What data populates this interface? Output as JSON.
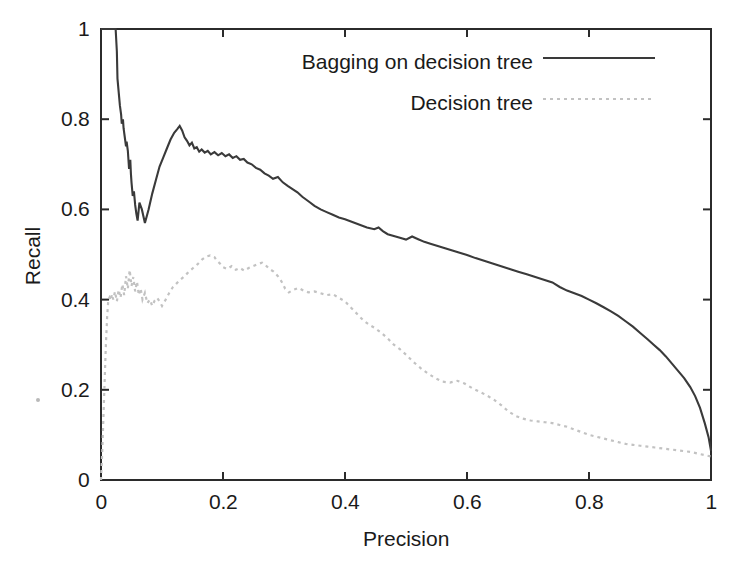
{
  "figure": {
    "background_color": "#ffffff",
    "frame_color": "#2b2b2b"
  },
  "axes": {
    "x": {
      "label": "Precision",
      "ticks": [
        "0",
        "0.2",
        "0.4",
        "0.6",
        "0.8",
        "1"
      ],
      "tick_values": [
        0,
        0.2,
        0.4,
        0.6,
        0.8,
        1
      ],
      "min": 0,
      "max": 1
    },
    "y": {
      "label": "Recall",
      "ticks": [
        "0",
        "0.2",
        "0.4",
        "0.6",
        "0.8",
        "1"
      ],
      "tick_values": [
        0,
        0.2,
        0.4,
        0.6,
        0.8,
        1
      ],
      "min": 0,
      "max": 1
    }
  },
  "legend": {
    "position": "top-right",
    "entries": [
      {
        "label": "Bagging on decision tree",
        "style": "solid",
        "color": "#3a3a3a",
        "width": 2.1
      },
      {
        "label": "Decision tree",
        "style": "dotted",
        "color": "#c2c2c2",
        "width": 2.1
      }
    ]
  },
  "chart_data": {
    "type": "line",
    "title": "",
    "xlabel": "Precision",
    "ylabel": "Recall",
    "xlim": [
      0,
      1
    ],
    "ylim": [
      0,
      1
    ],
    "grid": false,
    "legend_position": "top-right",
    "series": [
      {
        "name": "Bagging on decision tree",
        "style": "solid",
        "color": "#3a3a3a",
        "x": [
          0,
          0.004,
          0.01,
          0.018,
          0.024,
          0.026,
          0.027,
          0.029,
          0.031,
          0.033,
          0.034,
          0.036,
          0.037,
          0.039,
          0.041,
          0.042,
          0.044,
          0.045,
          0.046,
          0.048,
          0.049,
          0.05,
          0.052,
          0.054,
          0.056,
          0.058,
          0.06,
          0.063,
          0.067,
          0.072,
          0.078,
          0.084,
          0.09,
          0.096,
          0.102,
          0.108,
          0.114,
          0.12,
          0.125,
          0.129,
          0.133,
          0.137,
          0.141,
          0.145,
          0.149,
          0.153,
          0.157,
          0.161,
          0.165,
          0.17,
          0.175,
          0.18,
          0.186,
          0.192,
          0.198,
          0.204,
          0.21,
          0.216,
          0.222,
          0.228,
          0.234,
          0.24,
          0.247,
          0.254,
          0.261,
          0.268,
          0.275,
          0.282,
          0.29,
          0.298,
          0.306,
          0.314,
          0.322,
          0.33,
          0.34,
          0.35,
          0.36,
          0.37,
          0.38,
          0.39,
          0.4,
          0.412,
          0.424,
          0.436,
          0.448,
          0.455,
          0.462,
          0.47,
          0.48,
          0.49,
          0.5,
          0.51,
          0.52,
          0.53,
          0.54,
          0.552,
          0.564,
          0.576,
          0.588,
          0.6,
          0.614,
          0.628,
          0.642,
          0.656,
          0.67,
          0.684,
          0.698,
          0.712,
          0.726,
          0.74,
          0.752,
          0.764,
          0.776,
          0.788,
          0.8,
          0.812,
          0.824,
          0.836,
          0.848,
          0.86,
          0.872,
          0.884,
          0.896,
          0.906,
          0.916,
          0.926,
          0.936,
          0.946,
          0.956,
          0.966,
          0.974,
          0.982,
          0.99,
          0.996,
          1.0
        ],
        "y": [
          1.0,
          1.0,
          1.0,
          1.0,
          1.0,
          0.95,
          0.89,
          0.86,
          0.83,
          0.81,
          0.79,
          0.8,
          0.78,
          0.76,
          0.74,
          0.75,
          0.73,
          0.71,
          0.69,
          0.71,
          0.68,
          0.66,
          0.63,
          0.64,
          0.61,
          0.59,
          0.575,
          0.615,
          0.6,
          0.57,
          0.6,
          0.635,
          0.665,
          0.695,
          0.715,
          0.735,
          0.755,
          0.77,
          0.778,
          0.785,
          0.775,
          0.76,
          0.752,
          0.742,
          0.748,
          0.735,
          0.738,
          0.728,
          0.733,
          0.726,
          0.73,
          0.722,
          0.727,
          0.72,
          0.725,
          0.718,
          0.722,
          0.714,
          0.718,
          0.71,
          0.712,
          0.704,
          0.7,
          0.692,
          0.688,
          0.68,
          0.675,
          0.668,
          0.672,
          0.66,
          0.652,
          0.645,
          0.638,
          0.628,
          0.618,
          0.608,
          0.6,
          0.594,
          0.588,
          0.582,
          0.578,
          0.572,
          0.566,
          0.56,
          0.556,
          0.56,
          0.552,
          0.545,
          0.541,
          0.537,
          0.533,
          0.54,
          0.534,
          0.528,
          0.524,
          0.519,
          0.514,
          0.509,
          0.504,
          0.499,
          0.492,
          0.486,
          0.48,
          0.474,
          0.468,
          0.462,
          0.456,
          0.45,
          0.444,
          0.438,
          0.428,
          0.42,
          0.414,
          0.408,
          0.4,
          0.392,
          0.383,
          0.374,
          0.364,
          0.352,
          0.34,
          0.326,
          0.312,
          0.3,
          0.288,
          0.274,
          0.258,
          0.242,
          0.226,
          0.206,
          0.186,
          0.16,
          0.125,
          0.095,
          0.065
        ]
      },
      {
        "name": "Decision tree",
        "style": "dotted",
        "color": "#c2c2c2",
        "x": [
          0,
          0.002,
          0.004,
          0.006,
          0.008,
          0.01,
          0.012,
          0.014,
          0.016,
          0.018,
          0.02,
          0.023,
          0.026,
          0.029,
          0.032,
          0.035,
          0.038,
          0.041,
          0.044,
          0.047,
          0.05,
          0.053,
          0.056,
          0.059,
          0.062,
          0.065,
          0.068,
          0.072,
          0.076,
          0.08,
          0.084,
          0.088,
          0.092,
          0.096,
          0.1,
          0.106,
          0.112,
          0.118,
          0.124,
          0.13,
          0.137,
          0.144,
          0.151,
          0.158,
          0.165,
          0.172,
          0.179,
          0.186,
          0.19,
          0.195,
          0.2,
          0.207,
          0.214,
          0.221,
          0.228,
          0.235,
          0.242,
          0.249,
          0.256,
          0.264,
          0.27,
          0.276,
          0.283,
          0.29,
          0.296,
          0.302,
          0.308,
          0.316,
          0.324,
          0.332,
          0.34,
          0.35,
          0.36,
          0.37,
          0.38,
          0.39,
          0.4,
          0.41,
          0.42,
          0.43,
          0.44,
          0.45,
          0.46,
          0.47,
          0.48,
          0.49,
          0.5,
          0.512,
          0.524,
          0.536,
          0.548,
          0.56,
          0.572,
          0.584,
          0.596,
          0.608,
          0.62,
          0.632,
          0.644,
          0.656,
          0.668,
          0.68,
          0.692,
          0.704,
          0.716,
          0.728,
          0.74,
          0.752,
          0.764,
          0.776,
          0.788,
          0.8,
          0.812,
          0.824,
          0.836,
          0.848,
          0.86,
          0.872,
          0.884,
          0.896,
          0.908,
          0.92,
          0.932,
          0.944,
          0.956,
          0.968,
          0.98,
          0.99,
          1.0
        ],
        "y": [
          0.0,
          0.06,
          0.14,
          0.22,
          0.3,
          0.36,
          0.4,
          0.405,
          0.398,
          0.412,
          0.4,
          0.418,
          0.396,
          0.422,
          0.404,
          0.434,
          0.41,
          0.452,
          0.424,
          0.466,
          0.43,
          0.45,
          0.418,
          0.44,
          0.41,
          0.425,
          0.4,
          0.415,
          0.392,
          0.4,
          0.386,
          0.398,
          0.404,
          0.396,
          0.386,
          0.4,
          0.415,
          0.428,
          0.436,
          0.444,
          0.452,
          0.462,
          0.47,
          0.478,
          0.488,
          0.495,
          0.498,
          0.494,
          0.486,
          0.48,
          0.472,
          0.468,
          0.474,
          0.466,
          0.47,
          0.464,
          0.47,
          0.474,
          0.478,
          0.482,
          0.476,
          0.468,
          0.462,
          0.452,
          0.44,
          0.424,
          0.416,
          0.422,
          0.426,
          0.42,
          0.416,
          0.418,
          0.414,
          0.41,
          0.412,
          0.404,
          0.396,
          0.382,
          0.368,
          0.354,
          0.344,
          0.336,
          0.326,
          0.314,
          0.3,
          0.29,
          0.278,
          0.262,
          0.248,
          0.236,
          0.226,
          0.218,
          0.216,
          0.22,
          0.214,
          0.204,
          0.196,
          0.188,
          0.178,
          0.166,
          0.152,
          0.142,
          0.136,
          0.132,
          0.13,
          0.128,
          0.126,
          0.122,
          0.118,
          0.112,
          0.106,
          0.1,
          0.096,
          0.092,
          0.088,
          0.084,
          0.08,
          0.078,
          0.076,
          0.074,
          0.072,
          0.07,
          0.068,
          0.066,
          0.064,
          0.062,
          0.058,
          0.055,
          0.052
        ]
      }
    ]
  }
}
